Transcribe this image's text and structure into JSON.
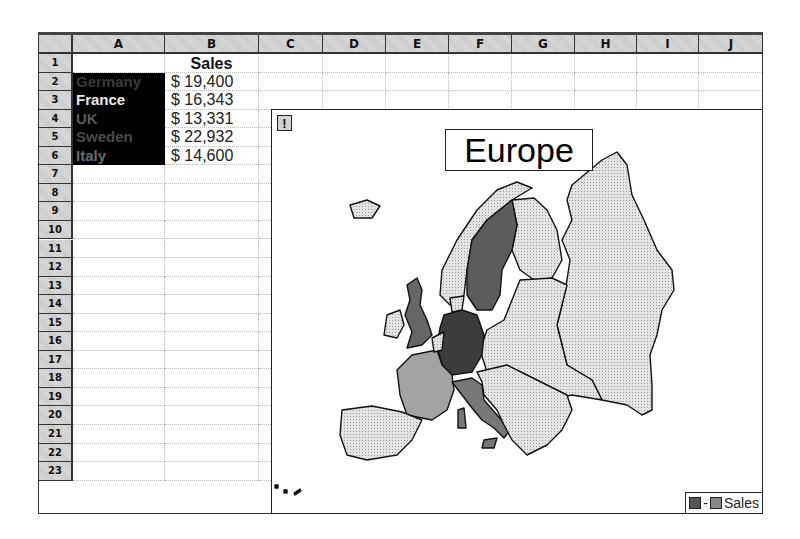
{
  "spreadsheet": {
    "columns": [
      "A",
      "B",
      "C",
      "D",
      "E",
      "F",
      "G",
      "H",
      "I",
      "J"
    ],
    "rows": [
      "1",
      "2",
      "3",
      "4",
      "5",
      "6",
      "7",
      "8",
      "9",
      "10",
      "11",
      "12",
      "13",
      "14",
      "15",
      "16",
      "17",
      "18",
      "19",
      "20",
      "21",
      "22",
      "23"
    ],
    "header_cell": "Sales",
    "data": [
      {
        "country": "Germany",
        "sales": "$ 19,400",
        "color": "#3a3a3a"
      },
      {
        "country": "France",
        "sales": "$ 16,343",
        "color": "#e8e8e8"
      },
      {
        "country": "UK",
        "sales": "$ 13,331",
        "color": "#5a5a5a"
      },
      {
        "country": "Sweden",
        "sales": "$ 22,932",
        "color": "#4a4a4a"
      },
      {
        "country": "Italy",
        "sales": "$ 14,600",
        "color": "#6a6a6a"
      }
    ]
  },
  "map": {
    "title": "Europe",
    "alert_button": "!",
    "legend": {
      "separator": "-",
      "label": "Sales",
      "swatch_low": "#555555",
      "swatch_high": "#888888"
    },
    "fills": {
      "Germany": "#3c3c3c",
      "Sweden": "#5c5c5c",
      "UK": "#666666",
      "Italy": "#777777",
      "France": "#a3a3a3",
      "other": "#d9d9d9"
    }
  }
}
